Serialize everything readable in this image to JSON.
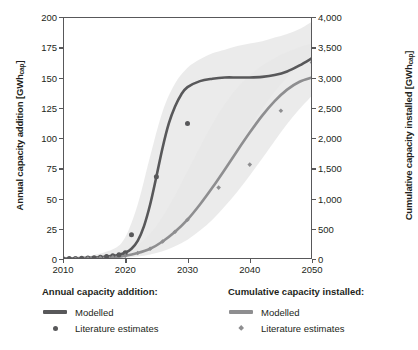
{
  "chart_data": {
    "type": "line",
    "title": "",
    "xlabel": "",
    "xlim": [
      2010,
      2050
    ],
    "xticks": [
      2010,
      2020,
      2030,
      2040,
      2050
    ],
    "xticklabels": [
      "2010",
      "2020",
      "2030",
      "2040",
      "2050"
    ],
    "grid": false,
    "legend_position": "below-plot",
    "axes": {
      "left": {
        "label_text": "Annual capacity addition [GWh",
        "label_sub": "cap",
        "label_suffix": "]",
        "label_full": "Annual capacity addition [GWhcap]",
        "ylim": [
          0,
          200
        ],
        "yticks": [
          0,
          25,
          50,
          75,
          100,
          125,
          150,
          175,
          200
        ],
        "yticklabels": [
          "0",
          "25",
          "50",
          "75",
          "100",
          "125",
          "150",
          "175",
          "200"
        ]
      },
      "right": {
        "label_text": "Cumulative capacity installed [GWh",
        "label_sub": "cap",
        "label_suffix": "]",
        "label_full": "Cumulative capacity installed [GWhcap]",
        "ylim": [
          0,
          4000
        ],
        "yticks": [
          0,
          500,
          1000,
          1500,
          2000,
          2500,
          3000,
          3500,
          4000
        ],
        "yticklabels": [
          "0",
          "500",
          "1,000",
          "1,500",
          "2,000",
          "2,500",
          "3,000",
          "3,500",
          "4,000"
        ]
      }
    },
    "colors": {
      "annual_line": "#58585a",
      "cumulative_line": "#8e8e90",
      "annual_marker": "#58585a",
      "cumulative_marker": "#8e8e90",
      "band": "#e8e8e8",
      "band_overlap": "#dcdcdc",
      "axis": "#58585a",
      "text": "#231f20",
      "background": "#ffffff"
    },
    "series": [
      {
        "name": "Annual capacity addition - Modelled",
        "axis": "left",
        "kind": "line",
        "x": [
          2010,
          2012,
          2014,
          2016,
          2018,
          2019,
          2020,
          2021,
          2022,
          2023,
          2024,
          2025,
          2026,
          2027,
          2028,
          2029,
          2030,
          2032,
          2034,
          2036,
          2038,
          2040,
          2042,
          2044,
          2046,
          2048,
          2050
        ],
        "values": [
          0.3,
          0.5,
          0.9,
          1.5,
          2.6,
          3.6,
          5.2,
          8.5,
          15,
          27,
          45,
          68,
          92,
          112,
          126,
          136,
          142,
          147,
          149,
          150,
          150,
          150,
          150.5,
          152,
          155,
          160,
          166
        ]
      },
      {
        "name": "Annual capacity addition - Literature estimates",
        "axis": "left",
        "kind": "scatter",
        "marker": "circle",
        "x": [
          2010,
          2011,
          2012,
          2013,
          2014,
          2015,
          2016,
          2017,
          2018,
          2019,
          2020,
          2021,
          2025,
          2030
        ],
        "values": [
          0.3,
          0.4,
          0.5,
          0.7,
          0.9,
          1.1,
          1.5,
          2.0,
          2.6,
          3.6,
          5.2,
          20.0,
          68.0,
          112.0
        ]
      },
      {
        "name": "Cumulative capacity installed - Modelled",
        "axis": "right",
        "kind": "line",
        "x": [
          2010,
          2014,
          2018,
          2020,
          2022,
          2024,
          2026,
          2028,
          2030,
          2032,
          2034,
          2036,
          2038,
          2040,
          2042,
          2044,
          2046,
          2048,
          2050
        ],
        "values": [
          2,
          10,
          30,
          55,
          100,
          170,
          290,
          450,
          650,
          900,
          1180,
          1480,
          1790,
          2090,
          2370,
          2610,
          2800,
          2930,
          3000
        ]
      },
      {
        "name": "Cumulative capacity installed - Literature estimates",
        "axis": "right",
        "kind": "scatter",
        "marker": "diamond",
        "x": [
          2010,
          2012,
          2014,
          2016,
          2018,
          2020,
          2022,
          2024,
          2026,
          2028,
          2030,
          2035,
          2040,
          2045,
          2050
        ],
        "values": [
          2,
          5,
          10,
          18,
          30,
          55,
          100,
          170,
          290,
          450,
          650,
          1180,
          1560,
          2450,
          3250
        ]
      }
    ],
    "bands": [
      {
        "name": "Annual capacity addition uncertainty band",
        "axis": "left",
        "x": [
          2014,
          2018,
          2020,
          2022,
          2024,
          2026,
          2028,
          2030,
          2032,
          2034,
          2036,
          2038,
          2040,
          2042,
          2044,
          2046,
          2048,
          2050
        ],
        "upper": [
          2,
          8,
          18,
          45,
          85,
          122,
          145,
          158,
          165,
          170,
          173,
          176,
          178,
          180,
          183,
          186,
          190,
          196
        ],
        "lower": [
          0,
          1,
          2,
          4,
          8,
          14,
          22,
          32,
          45,
          60,
          76,
          92,
          108,
          124,
          138,
          150,
          160,
          168
        ]
      },
      {
        "name": "Cumulative capacity installed uncertainty band",
        "axis": "right",
        "x": [
          2014,
          2018,
          2020,
          2022,
          2024,
          2026,
          2028,
          2030,
          2032,
          2034,
          2036,
          2038,
          2040,
          2042,
          2044,
          2046,
          2048,
          2050
        ],
        "upper": [
          20,
          60,
          120,
          230,
          420,
          700,
          1050,
          1450,
          1850,
          2230,
          2560,
          2830,
          3040,
          3200,
          3320,
          3420,
          3500,
          3560
        ],
        "lower": [
          2,
          10,
          20,
          40,
          75,
          130,
          210,
          320,
          470,
          650,
          870,
          1110,
          1380,
          1660,
          1950,
          2230,
          2480,
          2700
        ]
      }
    ]
  },
  "legend": {
    "groups": [
      {
        "heading": "Annual capacity addition:",
        "items": [
          {
            "label": "Modelled",
            "marker": "line"
          },
          {
            "label": "Literature estimates",
            "marker": "circle"
          }
        ]
      },
      {
        "heading": "Cumulative capacity installed:",
        "items": [
          {
            "label": "Modelled",
            "marker": "line"
          },
          {
            "label": "Literature estimates",
            "marker": "diamond"
          }
        ]
      }
    ]
  }
}
